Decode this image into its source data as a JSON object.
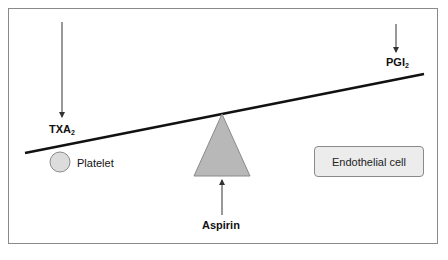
{
  "diagram": {
    "type": "balance/seesaw",
    "labels": {
      "txa_main": "TXA",
      "txa_sub": "2",
      "pgi_main": "PGI",
      "pgi_sub": "2",
      "platelet": "Platelet",
      "endothelial_cell": "Endothelial cell",
      "aspirin": "Aspirin"
    },
    "colors": {
      "frame_border": "#8a8a8a",
      "lever": "#111111",
      "fulcrum_fill": "#b8b8b8",
      "fulcrum_stroke": "#8a8a8a",
      "platelet_fill": "#dcdcdc",
      "cell_box_fill": "#ececec",
      "arrow": "#333333"
    }
  }
}
